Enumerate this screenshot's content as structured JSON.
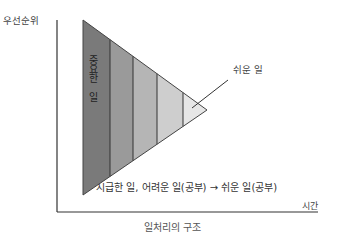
{
  "diagram": {
    "title": "일처리의 구조",
    "y_axis_label": "우선순위",
    "x_axis_label": "시간",
    "important_label": "중요한 일",
    "easy_label": "쉬운 일",
    "caption": "시급한 일, 어려운 일(공부) → 쉬운 일(공부)",
    "segments": [
      {
        "name": "segment-1",
        "color": "#7a7a7a"
      },
      {
        "name": "segment-2",
        "color": "#9a9a9a"
      },
      {
        "name": "segment-3",
        "color": "#b5b5b5"
      },
      {
        "name": "segment-4",
        "color": "#cecece"
      },
      {
        "name": "segment-5",
        "color": "#e6e6e6"
      }
    ],
    "colors": {
      "axis": "#333333",
      "outline": "#444444"
    }
  }
}
